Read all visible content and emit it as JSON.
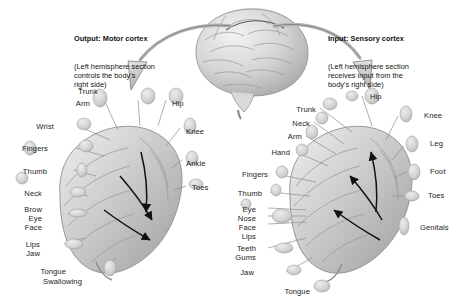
{
  "figure": {
    "background": "#ffffff",
    "ink": "#1c1c1c",
    "tissue_light": "#e9e9e9",
    "tissue_mid": "#c6c6c6",
    "tissue_dark": "#9a9a9a",
    "leader_color": "#8c8c8c",
    "arrow_fill": "#cfcfcf",
    "arrow_stroke": "#5a5a5a"
  },
  "captions": {
    "left": {
      "heading": "Output: Motor cortex",
      "body": "(Left hemisphere section\ncontrols the body's\nright side)"
    },
    "right": {
      "heading": "Input: Sensory cortex",
      "body": "(Left hemisphere section\nreceives input from the\nbody's right side)"
    }
  },
  "brain": {
    "name": "whole-brain",
    "view": "lateral left hemisphere"
  },
  "motor_panel": {
    "name": "motor-cortex-homunculus",
    "arrow_direction": "outward-down",
    "labels": [
      {
        "text": "Trunk",
        "x": 88,
        "y": 88,
        "align": "center"
      },
      {
        "text": "Arm",
        "x": 90,
        "y": 100,
        "align": "right"
      },
      {
        "text": "Wrist",
        "x": 54,
        "y": 123,
        "align": "right"
      },
      {
        "text": "Fingers",
        "x": 48,
        "y": 145,
        "align": "right"
      },
      {
        "text": "Thumb",
        "x": 47,
        "y": 168,
        "align": "right"
      },
      {
        "text": "Neck",
        "x": 42,
        "y": 190,
        "align": "right"
      },
      {
        "text": "Brow",
        "x": 42,
        "y": 206,
        "align": "right"
      },
      {
        "text": "Eye",
        "x": 42,
        "y": 215,
        "align": "right"
      },
      {
        "text": "Face",
        "x": 42,
        "y": 224,
        "align": "right"
      },
      {
        "text": "Lips",
        "x": 40,
        "y": 241,
        "align": "right"
      },
      {
        "text": "Jaw",
        "x": 40,
        "y": 250,
        "align": "right"
      },
      {
        "text": "Tongue",
        "x": 66,
        "y": 268,
        "align": "right"
      },
      {
        "text": "Swallowing",
        "x": 82,
        "y": 278,
        "align": "right"
      },
      {
        "text": "Hip",
        "x": 172,
        "y": 100,
        "align": "left"
      },
      {
        "text": "Knee",
        "x": 186,
        "y": 128,
        "align": "left"
      },
      {
        "text": "Ankle",
        "x": 186,
        "y": 160,
        "align": "left"
      },
      {
        "text": "Toes",
        "x": 192,
        "y": 184,
        "align": "left"
      }
    ]
  },
  "sensory_panel": {
    "name": "sensory-cortex-homunculus",
    "arrow_direction": "inward-up",
    "labels": [
      {
        "text": "Trunk",
        "x": 316,
        "y": 106,
        "align": "right"
      },
      {
        "text": "Neck",
        "x": 310,
        "y": 120,
        "align": "right"
      },
      {
        "text": "Arm",
        "x": 302,
        "y": 133,
        "align": "right"
      },
      {
        "text": "Hand",
        "x": 290,
        "y": 149,
        "align": "right"
      },
      {
        "text": "Fingers",
        "x": 268,
        "y": 171,
        "align": "right"
      },
      {
        "text": "Thumb",
        "x": 262,
        "y": 190,
        "align": "right"
      },
      {
        "text": "Eye",
        "x": 256,
        "y": 206,
        "align": "right"
      },
      {
        "text": "Nose",
        "x": 256,
        "y": 215,
        "align": "right"
      },
      {
        "text": "Face",
        "x": 256,
        "y": 224,
        "align": "right"
      },
      {
        "text": "Lips",
        "x": 256,
        "y": 233,
        "align": "right"
      },
      {
        "text": "Teeth",
        "x": 256,
        "y": 245,
        "align": "right"
      },
      {
        "text": "Gums",
        "x": 256,
        "y": 254,
        "align": "right"
      },
      {
        "text": "Jaw",
        "x": 254,
        "y": 269,
        "align": "right"
      },
      {
        "text": "Tongue",
        "x": 310,
        "y": 288,
        "align": "right"
      },
      {
        "text": "Hip",
        "x": 370,
        "y": 93,
        "align": "left"
      },
      {
        "text": "Knee",
        "x": 424,
        "y": 112,
        "align": "left"
      },
      {
        "text": "Leg",
        "x": 430,
        "y": 140,
        "align": "left"
      },
      {
        "text": "Foot",
        "x": 430,
        "y": 168,
        "align": "left"
      },
      {
        "text": "Toes",
        "x": 428,
        "y": 192,
        "align": "left"
      },
      {
        "text": "Genitals",
        "x": 420,
        "y": 224,
        "align": "left"
      }
    ]
  }
}
